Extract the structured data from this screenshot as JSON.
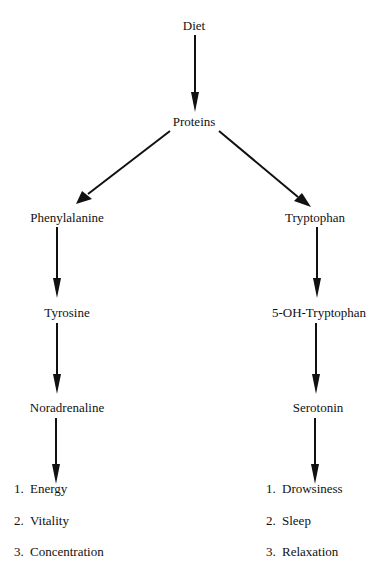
{
  "diagram": {
    "root": "Diet",
    "level1": "Proteins",
    "left_branch": {
      "nodes": [
        "Phenylalanine",
        "Tyrosine",
        "Noradrenaline"
      ],
      "effects": [
        {
          "num": "1.",
          "label": "Energy"
        },
        {
          "num": "2.",
          "label": "Vitality"
        },
        {
          "num": "3.",
          "label": "Concentration"
        }
      ]
    },
    "right_branch": {
      "nodes": [
        "Tryptophan",
        "5-OH-Tryptophan",
        "Serotonin"
      ],
      "effects": [
        {
          "num": "1.",
          "label": "Drowsiness"
        },
        {
          "num": "2.",
          "label": "Sleep"
        },
        {
          "num": "3.",
          "label": "Relaxation"
        }
      ]
    },
    "edges": [
      [
        "Diet",
        "Proteins"
      ],
      [
        "Proteins",
        "Phenylalanine"
      ],
      [
        "Proteins",
        "Tryptophan"
      ],
      [
        "Phenylalanine",
        "Tyrosine"
      ],
      [
        "Tyrosine",
        "Noradrenaline"
      ],
      [
        "Noradrenaline",
        "effects-left"
      ],
      [
        "Tryptophan",
        "5-OH-Tryptophan"
      ],
      [
        "5-OH-Tryptophan",
        "Serotonin"
      ],
      [
        "Serotonin",
        "effects-right"
      ]
    ],
    "colors": {
      "line": "#111111",
      "background": "#ffffff"
    }
  }
}
